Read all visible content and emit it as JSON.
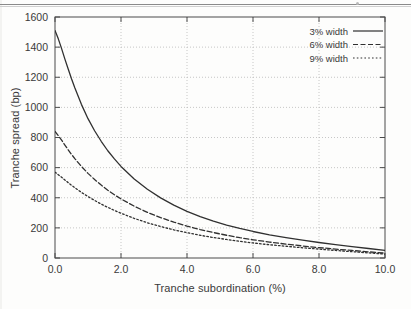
{
  "figure": {
    "caption_none": "",
    "background_note": "scanned page figure"
  },
  "chart_data": {
    "type": "line",
    "title": "",
    "subtitle": "",
    "xlabel": "Tranche subordination (%)",
    "ylabel": "Tranche spread (bp)",
    "xlim": [
      0.0,
      10.0
    ],
    "ylim": [
      0,
      1600
    ],
    "xticks": [
      "0.0",
      "2.0",
      "4.0",
      "6.0",
      "8.0",
      "10.0"
    ],
    "xtick_values": [
      0.0,
      2.0,
      4.0,
      6.0,
      8.0,
      10.0
    ],
    "yticks": [
      "0",
      "200",
      "400",
      "600",
      "800",
      "1000",
      "1200",
      "1400",
      "1600"
    ],
    "ytick_values": [
      0,
      200,
      400,
      600,
      800,
      1000,
      1200,
      1400,
      1600
    ],
    "grid": true,
    "grid_style": "dotted",
    "legend_position": "top-right",
    "x": [
      0.0,
      0.1,
      0.2,
      0.3,
      0.4,
      0.5,
      0.6,
      0.8,
      1.0,
      1.2,
      1.4,
      1.6,
      1.8,
      2.0,
      2.4,
      2.8,
      3.2,
      3.6,
      4.0,
      4.4,
      4.8,
      5.2,
      5.6,
      6.0,
      6.5,
      7.0,
      7.5,
      8.0,
      8.5,
      9.0,
      9.5,
      10.0
    ],
    "series": [
      {
        "name": "3% width",
        "style": "solid",
        "color": "#303030",
        "values": [
          1510,
          1455,
          1390,
          1320,
          1255,
          1190,
          1130,
          1020,
          925,
          845,
          775,
          712,
          658,
          608,
          525,
          456,
          399,
          351,
          310,
          275,
          245,
          219,
          196,
          176,
          154,
          135,
          118,
          103,
          89,
          76,
          63,
          50
        ]
      },
      {
        "name": "6% width",
        "style": "dashed",
        "color": "#303030",
        "values": [
          840,
          812,
          782,
          750,
          718,
          688,
          660,
          608,
          562,
          521,
          484,
          450,
          420,
          392,
          344,
          303,
          268,
          238,
          212,
          189,
          169,
          151,
          135,
          121,
          106,
          92,
          80,
          69,
          59,
          50,
          41,
          32
        ]
      },
      {
        "name": "9% width",
        "style": "dotted",
        "color": "#303030",
        "values": [
          570,
          553,
          536,
          518,
          500,
          483,
          467,
          436,
          408,
          382,
          358,
          336,
          316,
          297,
          263,
          234,
          209,
          187,
          168,
          151,
          136,
          123,
          111,
          100,
          88,
          78,
          68,
          59,
          50,
          42,
          34,
          26
        ]
      }
    ],
    "legend": [
      {
        "label": "3% width",
        "style": "solid"
      },
      {
        "label": "6% width",
        "style": "dashed"
      },
      {
        "label": "9% width",
        "style": "dotted"
      }
    ]
  }
}
